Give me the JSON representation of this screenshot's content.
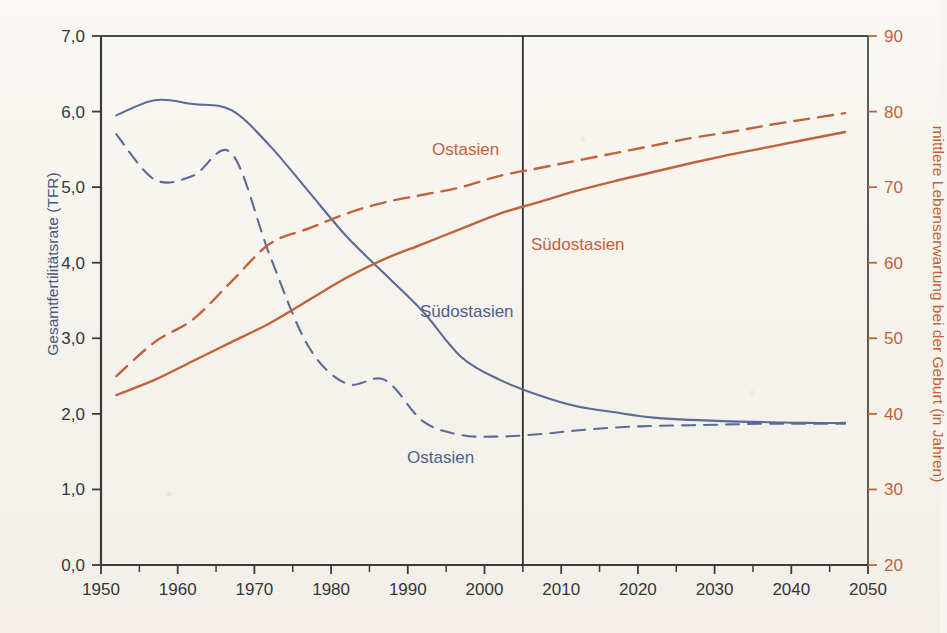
{
  "chart_data": {
    "type": "line",
    "title": "",
    "xlabel": "",
    "ylabel": "Gesamtfertilitätsrate (TFR)",
    "ylabel_right": "mittlere Lebenserwartung bei der Geburt (in Jahren)",
    "xlim": [
      1950,
      2050
    ],
    "ylim": [
      0.0,
      7.0
    ],
    "ylim_right": [
      20,
      90
    ],
    "grid": false,
    "legend_position": "inline-annotations",
    "x_ticks": [
      1950,
      1960,
      1970,
      1980,
      1990,
      2000,
      2010,
      2020,
      2030,
      2040,
      2050
    ],
    "x_tick_labels": [
      "1950",
      "1960",
      "1970",
      "1980",
      "1990",
      "2000",
      "2010",
      "2020",
      "2030",
      "2040",
      "2050"
    ],
    "x_minor_ticks": [
      1955,
      1965,
      1975,
      1985,
      1995,
      2005,
      2015,
      2025,
      2035,
      2045
    ],
    "y_ticks": [
      0.0,
      1.0,
      2.0,
      3.0,
      4.0,
      5.0,
      6.0,
      7.0
    ],
    "y_tick_labels": [
      "0,0",
      "1,0",
      "2,0",
      "3,0",
      "4,0",
      "5,0",
      "6,0",
      "7,0"
    ],
    "y_right_ticks": [
      20,
      30,
      40,
      50,
      60,
      70,
      80,
      90
    ],
    "y_right_tick_labels": [
      "20",
      "30",
      "40",
      "50",
      "60",
      "70",
      "80",
      "90"
    ],
    "annotations": [
      {
        "text": "Ostasien",
        "x": 1990,
        "y_axis": "right",
        "color": "#c1623a"
      },
      {
        "text": "Südostasien",
        "x": 2007,
        "y_axis": "right",
        "color": "#c1623a"
      },
      {
        "text": "Südostasien",
        "x": 1991,
        "y_axis": "left",
        "color": "#4f5f8b"
      },
      {
        "text": "Ostasien",
        "x": 1988,
        "y_axis": "left",
        "color": "#4f5f8b"
      }
    ],
    "reference_line": {
      "x": 2005,
      "label": "",
      "color": "#2f2f2f"
    },
    "series": [
      {
        "name": "Südostasien",
        "axis": "left",
        "measure": "Gesamtfertilitätsrate (TFR)",
        "style": "solid",
        "color": "#5a6b96",
        "x": [
          1952,
          1957,
          1962,
          1967,
          1972,
          1977,
          1982,
          1987,
          1992,
          1997,
          2002,
          2007,
          2012,
          2017,
          2022,
          2027,
          2032,
          2037,
          2042,
          2047
        ],
        "values": [
          5.95,
          6.15,
          6.1,
          6.02,
          5.55,
          4.95,
          4.35,
          3.85,
          3.35,
          2.75,
          2.45,
          2.25,
          2.1,
          2.02,
          1.95,
          1.92,
          1.9,
          1.89,
          1.88,
          1.88
        ]
      },
      {
        "name": "Ostasien",
        "axis": "left",
        "measure": "Gesamtfertilitätsrate (TFR)",
        "style": "dashed",
        "color": "#5a6b96",
        "x": [
          1952,
          1957,
          1962,
          1967,
          1972,
          1977,
          1982,
          1987,
          1992,
          1997,
          2002,
          2007,
          2012,
          2017,
          2022,
          2027,
          2032,
          2037,
          2042,
          2047
        ],
        "values": [
          5.7,
          5.1,
          5.15,
          5.45,
          4.1,
          2.9,
          2.4,
          2.45,
          1.9,
          1.72,
          1.7,
          1.73,
          1.78,
          1.82,
          1.84,
          1.85,
          1.86,
          1.87,
          1.87,
          1.87
        ]
      },
      {
        "name": "Ostasien",
        "axis": "right",
        "measure": "mittlere Lebenserwartung bei der Geburt (in Jahren)",
        "style": "dashed",
        "color": "#c1623a",
        "x": [
          1952,
          1957,
          1962,
          1967,
          1972,
          1977,
          1982,
          1987,
          1992,
          1997,
          2002,
          2007,
          2012,
          2017,
          2022,
          2027,
          2032,
          2037,
          2042,
          2047
        ],
        "values": [
          45.0,
          49.5,
          52.5,
          57.5,
          62.5,
          64.5,
          66.5,
          68.0,
          69.0,
          70.0,
          71.5,
          72.5,
          73.5,
          74.5,
          75.5,
          76.5,
          77.3,
          78.2,
          79.0,
          79.8
        ]
      },
      {
        "name": "Südostasien",
        "axis": "right",
        "measure": "mittlere Lebenserwartung bei der Geburt (in Jahren)",
        "style": "solid",
        "color": "#c1623a",
        "x": [
          1952,
          1957,
          1962,
          1967,
          1972,
          1977,
          1982,
          1987,
          1992,
          1997,
          2002,
          2007,
          2012,
          2017,
          2022,
          2027,
          2032,
          2037,
          2042,
          2047
        ],
        "values": [
          42.5,
          44.5,
          47.0,
          49.5,
          52.0,
          55.0,
          58.0,
          60.5,
          62.5,
          64.5,
          66.5,
          68.0,
          69.5,
          70.8,
          72.0,
          73.2,
          74.3,
          75.3,
          76.3,
          77.3
        ]
      }
    ]
  },
  "axes": {
    "left_title": "Gesamtfertilitätsrate (TFR)",
    "right_title": "mittlere Lebenserwartung bei der Geburt (in Jahren)"
  },
  "labels": {
    "orange_dashed": "Ostasien",
    "orange_solid": "Südostasien",
    "blue_solid": "Südostasien",
    "blue_dashed": "Ostasien"
  }
}
